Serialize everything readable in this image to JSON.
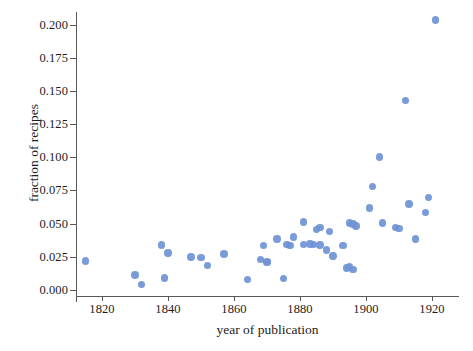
{
  "figure": {
    "background_color": "#ffffff",
    "marker_color": "#6f93d6",
    "axis_color": "#585858",
    "text_color": "#1c1c1c"
  },
  "chart_data": {
    "type": "scatter",
    "title": "",
    "xlabel": "year of publication",
    "ylabel": "fraction of recipes",
    "xlim": [
      1810,
      1929
    ],
    "ylim": [
      -0.006,
      0.2115
    ],
    "grid": false,
    "legend": null,
    "xticks": [
      1820,
      1840,
      1860,
      1880,
      1900,
      1920
    ],
    "xtick_labels": [
      "1820",
      "1840",
      "1860",
      "1880",
      "1900",
      "1920"
    ],
    "yticks": [
      0.0,
      0.025,
      0.05,
      0.075,
      0.1,
      0.125,
      0.15,
      0.175,
      0.2
    ],
    "ytick_labels": [
      "0.000",
      "0.025",
      "0.050",
      "0.075",
      "0.100",
      "0.125",
      "0.150",
      "0.175",
      "0.200"
    ],
    "marker": "circle",
    "marker_size_px": 7.4,
    "points": [
      {
        "x": 1815,
        "y": 0.0218
      },
      {
        "x": 1830,
        "y": 0.0113
      },
      {
        "x": 1832,
        "y": 0.0042
      },
      {
        "x": 1838,
        "y": 0.0338
      },
      {
        "x": 1839,
        "y": 0.0091
      },
      {
        "x": 1840,
        "y": 0.0279
      },
      {
        "x": 1847,
        "y": 0.0248
      },
      {
        "x": 1850,
        "y": 0.0247
      },
      {
        "x": 1852,
        "y": 0.0185
      },
      {
        "x": 1857,
        "y": 0.0271
      },
      {
        "x": 1864,
        "y": 0.008
      },
      {
        "x": 1868,
        "y": 0.0232
      },
      {
        "x": 1869,
        "y": 0.0334
      },
      {
        "x": 1870,
        "y": 0.0216
      },
      {
        "x": 1870,
        "y": 0.0206
      },
      {
        "x": 1873,
        "y": 0.0383
      },
      {
        "x": 1875,
        "y": 0.0085
      },
      {
        "x": 1876,
        "y": 0.0345
      },
      {
        "x": 1877,
        "y": 0.0335
      },
      {
        "x": 1878,
        "y": 0.04
      },
      {
        "x": 1881,
        "y": 0.0513
      },
      {
        "x": 1881,
        "y": 0.0344
      },
      {
        "x": 1883,
        "y": 0.0347
      },
      {
        "x": 1884,
        "y": 0.0341
      },
      {
        "x": 1885,
        "y": 0.0458
      },
      {
        "x": 1886,
        "y": 0.0471
      },
      {
        "x": 1886,
        "y": 0.0338
      },
      {
        "x": 1888,
        "y": 0.0302
      },
      {
        "x": 1889,
        "y": 0.044
      },
      {
        "x": 1890,
        "y": 0.0257
      },
      {
        "x": 1893,
        "y": 0.0335
      },
      {
        "x": 1894,
        "y": 0.0165
      },
      {
        "x": 1895,
        "y": 0.0172
      },
      {
        "x": 1895,
        "y": 0.0505
      },
      {
        "x": 1896,
        "y": 0.0498
      },
      {
        "x": 1896,
        "y": 0.0155
      },
      {
        "x": 1897,
        "y": 0.0481
      },
      {
        "x": 1901,
        "y": 0.0619
      },
      {
        "x": 1902,
        "y": 0.0779
      },
      {
        "x": 1904,
        "y": 0.1002
      },
      {
        "x": 1905,
        "y": 0.0506
      },
      {
        "x": 1909,
        "y": 0.0472
      },
      {
        "x": 1910,
        "y": 0.0463
      },
      {
        "x": 1912,
        "y": 0.1426
      },
      {
        "x": 1913,
        "y": 0.0648
      },
      {
        "x": 1915,
        "y": 0.0383
      },
      {
        "x": 1918,
        "y": 0.0582
      },
      {
        "x": 1919,
        "y": 0.0697
      },
      {
        "x": 1921,
        "y": 0.2035
      }
    ]
  }
}
